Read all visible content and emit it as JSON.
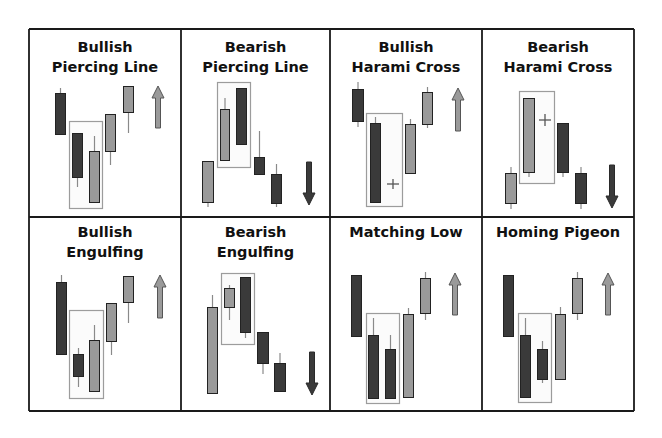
{
  "colors": {
    "background": "#ffffff",
    "grid_line": "#1a1a1a",
    "bearish_fill": "#3a3a3a",
    "bullish_fill": "#9a9a9a",
    "candle_outline": "#222222",
    "wick": "#8a8a8a",
    "highlight_box_stroke": "#9c9c9c",
    "highlight_box_fill": "#fbfbfb",
    "cross": "#555555",
    "title": "#111111"
  },
  "grid": {
    "x": [
      29,
      181,
      330,
      482,
      634
    ],
    "y": [
      29,
      217,
      411
    ]
  },
  "panels": [
    {
      "id": "bullish-piercing-line",
      "title_lines": [
        "Bullish",
        "Piercing Line"
      ],
      "title_y": [
        52,
        72
      ],
      "signal": "bullish",
      "box": {
        "x": 69,
        "y": 121,
        "w": 33,
        "h": 87
      },
      "candles": [
        {
          "type": "bearish",
          "x": 55,
          "w": 11,
          "top": 93,
          "bottom": 135,
          "wick_top": 88,
          "wick_bottom": 135
        },
        {
          "type": "bearish",
          "x": 72,
          "w": 11,
          "top": 133,
          "bottom": 178,
          "wick_top": 133,
          "wick_bottom": 187
        },
        {
          "type": "bullish",
          "x": 89,
          "w": 11,
          "top": 151,
          "bottom": 203,
          "wick_top": 136,
          "wick_bottom": 203
        },
        {
          "type": "bullish",
          "x": 105,
          "w": 11,
          "top": 114,
          "bottom": 152,
          "wick_top": 114,
          "wick_bottom": 165
        },
        {
          "type": "bullish",
          "x": 123,
          "w": 11,
          "top": 86,
          "bottom": 113,
          "wick_top": 86,
          "wick_bottom": 133
        }
      ],
      "crosses": [],
      "arrow": {
        "direction": "up",
        "x": 158,
        "y_start": 128,
        "y_end": 86
      }
    },
    {
      "id": "bearish-piercing-line",
      "title_lines": [
        "Bearish",
        "Piercing Line"
      ],
      "title_y": [
        52,
        72
      ],
      "signal": "bearish",
      "box": {
        "x": 217,
        "y": 82,
        "w": 33,
        "h": 85
      },
      "candles": [
        {
          "type": "bullish",
          "x": 202,
          "w": 12,
          "top": 161,
          "bottom": 203,
          "wick_top": 161,
          "wick_bottom": 207
        },
        {
          "type": "bullish",
          "x": 220,
          "w": 10,
          "top": 109,
          "bottom": 161,
          "wick_top": 98,
          "wick_bottom": 161
        },
        {
          "type": "bearish",
          "x": 236,
          "w": 11,
          "top": 88,
          "bottom": 145,
          "wick_top": 88,
          "wick_bottom": 145
        },
        {
          "type": "bearish",
          "x": 254,
          "w": 11,
          "top": 157,
          "bottom": 175,
          "wick_top": 131,
          "wick_bottom": 175
        },
        {
          "type": "bearish",
          "x": 271,
          "w": 11,
          "top": 174,
          "bottom": 204,
          "wick_top": 164,
          "wick_bottom": 207
        }
      ],
      "crosses": [],
      "arrow": {
        "direction": "down",
        "x": 309,
        "y_start": 162,
        "y_end": 205
      }
    },
    {
      "id": "bullish-harami-cross",
      "title_lines": [
        "Bullish",
        "Harami Cross"
      ],
      "title_y": [
        52,
        72
      ],
      "signal": "bullish",
      "box": {
        "x": 366,
        "y": 113,
        "w": 36,
        "h": 93
      },
      "candles": [
        {
          "type": "bearish",
          "x": 352,
          "w": 12,
          "top": 89,
          "bottom": 122,
          "wick_top": 82,
          "wick_bottom": 127
        },
        {
          "type": "bearish",
          "x": 370,
          "w": 11,
          "top": 123,
          "bottom": 203,
          "wick_top": 117,
          "wick_bottom": 203
        },
        {
          "type": "bullish",
          "x": 405,
          "w": 11,
          "top": 124,
          "bottom": 174,
          "wick_top": 119,
          "wick_bottom": 174
        },
        {
          "type": "bullish",
          "x": 422,
          "w": 11,
          "top": 92,
          "bottom": 125,
          "wick_top": 87,
          "wick_bottom": 128
        }
      ],
      "crosses": [
        {
          "cx": 393,
          "cy": 184,
          "half_w": 6,
          "half_h": 5
        }
      ],
      "arrow": {
        "direction": "up",
        "x": 458,
        "y_start": 131,
        "y_end": 88
      }
    },
    {
      "id": "bearish-harami-cross",
      "title_lines": [
        "Bearish",
        "Harami Cross"
      ],
      "title_y": [
        52,
        72
      ],
      "signal": "bearish",
      "box": {
        "x": 519,
        "y": 91,
        "w": 35,
        "h": 92
      },
      "candles": [
        {
          "type": "bullish",
          "x": 505,
          "w": 12,
          "top": 173,
          "bottom": 204,
          "wick_top": 167,
          "wick_bottom": 209
        },
        {
          "type": "bullish",
          "x": 523,
          "w": 12,
          "top": 98,
          "bottom": 173,
          "wick_top": 98,
          "wick_bottom": 177
        },
        {
          "type": "bearish",
          "x": 557,
          "w": 12,
          "top": 123,
          "bottom": 173,
          "wick_top": 123,
          "wick_bottom": 177
        },
        {
          "type": "bearish",
          "x": 575,
          "w": 12,
          "top": 173,
          "bottom": 204,
          "wick_top": 167,
          "wick_bottom": 209
        }
      ],
      "crosses": [
        {
          "cx": 545,
          "cy": 120,
          "half_w": 6,
          "half_h": 6
        }
      ],
      "arrow": {
        "direction": "down",
        "x": 612,
        "y_start": 165,
        "y_end": 208
      }
    },
    {
      "id": "bullish-engulfing",
      "title_lines": [
        "Bullish",
        "Engulfing"
      ],
      "title_y": [
        237,
        257
      ],
      "signal": "bullish",
      "box": {
        "x": 69,
        "y": 310,
        "w": 34,
        "h": 88
      },
      "candles": [
        {
          "type": "bearish",
          "x": 56,
          "w": 11,
          "top": 282,
          "bottom": 355,
          "wick_top": 275,
          "wick_bottom": 355
        },
        {
          "type": "bearish",
          "x": 73,
          "w": 11,
          "top": 354,
          "bottom": 377,
          "wick_top": 348,
          "wick_bottom": 387
        },
        {
          "type": "bullish",
          "x": 89,
          "w": 11,
          "top": 340,
          "bottom": 392,
          "wick_top": 325,
          "wick_bottom": 392
        },
        {
          "type": "bullish",
          "x": 106,
          "w": 11,
          "top": 303,
          "bottom": 342,
          "wick_top": 303,
          "wick_bottom": 355
        },
        {
          "type": "bullish",
          "x": 123,
          "w": 11,
          "top": 276,
          "bottom": 303,
          "wick_top": 276,
          "wick_bottom": 323
        }
      ],
      "crosses": [],
      "arrow": {
        "direction": "up",
        "x": 160,
        "y_start": 318,
        "y_end": 275
      }
    },
    {
      "id": "bearish-engulfing",
      "title_lines": [
        "Bearish",
        "Engulfing"
      ],
      "title_y": [
        237,
        257
      ],
      "signal": "bearish",
      "box": {
        "x": 221,
        "y": 273,
        "w": 33,
        "h": 71
      },
      "candles": [
        {
          "type": "bullish",
          "x": 207,
          "w": 11,
          "top": 307,
          "bottom": 394,
          "wick_top": 295,
          "wick_bottom": 394
        },
        {
          "type": "bullish",
          "x": 224,
          "w": 11,
          "top": 288,
          "bottom": 308,
          "wick_top": 285,
          "wick_bottom": 320
        },
        {
          "type": "bearish",
          "x": 240,
          "w": 11,
          "top": 277,
          "bottom": 333,
          "wick_top": 277,
          "wick_bottom": 338
        },
        {
          "type": "bearish",
          "x": 257,
          "w": 12,
          "top": 332,
          "bottom": 364,
          "wick_top": 332,
          "wick_bottom": 374
        },
        {
          "type": "bearish",
          "x": 274,
          "w": 12,
          "top": 363,
          "bottom": 392,
          "wick_top": 353,
          "wick_bottom": 392
        }
      ],
      "crosses": [],
      "arrow": {
        "direction": "down",
        "x": 312,
        "y_start": 352,
        "y_end": 395
      }
    },
    {
      "id": "matching-low",
      "title_lines": [
        "Matching Low"
      ],
      "title_y": [
        237
      ],
      "signal": "bullish",
      "box": {
        "x": 366,
        "y": 313,
        "w": 33,
        "h": 90
      },
      "candles": [
        {
          "type": "bearish",
          "x": 351,
          "w": 11,
          "top": 275,
          "bottom": 337,
          "wick_top": 275,
          "wick_bottom": 337
        },
        {
          "type": "bearish",
          "x": 368,
          "w": 11,
          "top": 335,
          "bottom": 399,
          "wick_top": 318,
          "wick_bottom": 399
        },
        {
          "type": "bearish",
          "x": 385,
          "w": 11,
          "top": 349,
          "bottom": 399,
          "wick_top": 335,
          "wick_bottom": 399
        },
        {
          "type": "bullish",
          "x": 403,
          "w": 11,
          "top": 314,
          "bottom": 398,
          "wick_top": 308,
          "wick_bottom": 398
        },
        {
          "type": "bullish",
          "x": 420,
          "w": 11,
          "top": 278,
          "bottom": 314,
          "wick_top": 272,
          "wick_bottom": 320
        }
      ],
      "crosses": [],
      "arrow": {
        "direction": "up",
        "x": 455,
        "y_start": 315,
        "y_end": 273
      }
    },
    {
      "id": "homing-pigeon",
      "title_lines": [
        "Homing Pigeon"
      ],
      "title_y": [
        237
      ],
      "signal": "bullish",
      "box": {
        "x": 518,
        "y": 313,
        "w": 33,
        "h": 89
      },
      "candles": [
        {
          "type": "bearish",
          "x": 503,
          "w": 11,
          "top": 275,
          "bottom": 337,
          "wick_top": 275,
          "wick_bottom": 337
        },
        {
          "type": "bearish",
          "x": 520,
          "w": 11,
          "top": 335,
          "bottom": 398,
          "wick_top": 318,
          "wick_bottom": 398
        },
        {
          "type": "bearish",
          "x": 537,
          "w": 11,
          "top": 349,
          "bottom": 380,
          "wick_top": 341,
          "wick_bottom": 383
        },
        {
          "type": "bullish",
          "x": 555,
          "w": 11,
          "top": 314,
          "bottom": 380,
          "wick_top": 307,
          "wick_bottom": 380
        },
        {
          "type": "bullish",
          "x": 572,
          "w": 11,
          "top": 278,
          "bottom": 314,
          "wick_top": 272,
          "wick_bottom": 320
        }
      ],
      "crosses": [],
      "arrow": {
        "direction": "up",
        "x": 608,
        "y_start": 315,
        "y_end": 273
      }
    }
  ]
}
